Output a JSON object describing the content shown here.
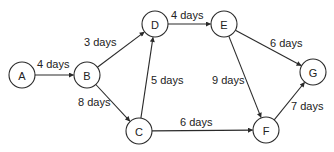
{
  "diagram": {
    "type": "network-diagram",
    "colors": {
      "stroke": "#2a2a2a",
      "text": "#222222",
      "background": "#ffffff"
    },
    "nodes": [
      {
        "id": "A",
        "label": "A",
        "x": 22,
        "y": 75,
        "r": 13
      },
      {
        "id": "B",
        "label": "B",
        "x": 87,
        "y": 75,
        "r": 13
      },
      {
        "id": "C",
        "label": "C",
        "x": 139,
        "y": 131,
        "r": 13
      },
      {
        "id": "D",
        "label": "D",
        "x": 155,
        "y": 24,
        "r": 13
      },
      {
        "id": "E",
        "label": "E",
        "x": 224,
        "y": 24,
        "r": 13
      },
      {
        "id": "F",
        "label": "F",
        "x": 266,
        "y": 130,
        "r": 13
      },
      {
        "id": "G",
        "label": "G",
        "x": 313,
        "y": 72,
        "r": 13
      }
    ],
    "edges": [
      {
        "from": "A",
        "to": "B",
        "label": "4 days",
        "lx": 37,
        "ly": 68
      },
      {
        "from": "B",
        "to": "D",
        "label": "3 days",
        "lx": 84,
        "ly": 46
      },
      {
        "from": "B",
        "to": "C",
        "label": "8 days",
        "lx": 78,
        "ly": 106
      },
      {
        "from": "C",
        "to": "D",
        "label": "5 days",
        "lx": 151,
        "ly": 84
      },
      {
        "from": "D",
        "to": "E",
        "label": "4 days",
        "lx": 171,
        "ly": 19
      },
      {
        "from": "E",
        "to": "G",
        "label": "6 days",
        "lx": 270,
        "ly": 47
      },
      {
        "from": "E",
        "to": "F",
        "label": "9 days",
        "lx": 212,
        "ly": 84
      },
      {
        "from": "C",
        "to": "F",
        "label": "6 days",
        "lx": 180,
        "ly": 126
      },
      {
        "from": "F",
        "to": "G",
        "label": "7 days",
        "lx": 291,
        "ly": 110
      }
    ]
  }
}
